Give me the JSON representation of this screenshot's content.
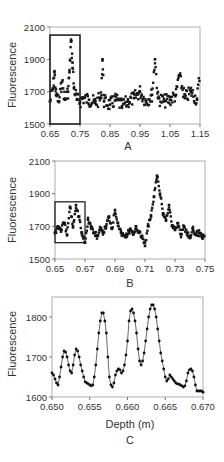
{
  "chart_data": [
    {
      "panel": "A",
      "type": "scatter",
      "title": "",
      "xlabel": "",
      "ylabel": "Fluorescence",
      "caption": "A",
      "xlim": [
        0.65,
        1.15
      ],
      "ylim": [
        1500,
        2100
      ],
      "xticks": [
        "0.65",
        "0.75",
        "0.85",
        "0.95",
        "1.05",
        "1.15"
      ],
      "yticks": [
        "1500",
        "1700",
        "1900",
        "2100"
      ],
      "grid": false,
      "highlight_box": {
        "x": [
          0.65,
          0.75
        ],
        "y": [
          1500,
          2050
        ]
      },
      "x": [
        0.65,
        0.66,
        0.665,
        0.67,
        0.68,
        0.69,
        0.7,
        0.71,
        0.715,
        0.72,
        0.725,
        0.73,
        0.74,
        0.75,
        0.76,
        0.78,
        0.8,
        0.82,
        0.825,
        0.83,
        0.85,
        0.87,
        0.89,
        0.91,
        0.93,
        0.95,
        0.97,
        0.99,
        1.0,
        1.01,
        1.03,
        1.05,
        1.07,
        1.08,
        1.1,
        1.12,
        1.14,
        1.15
      ],
      "values": [
        1640,
        1720,
        1820,
        1680,
        1640,
        1760,
        1650,
        1700,
        1820,
        2010,
        1880,
        1720,
        1650,
        1640,
        1660,
        1650,
        1630,
        1660,
        1900,
        1640,
        1620,
        1650,
        1610,
        1640,
        1660,
        1700,
        1640,
        1680,
        1900,
        1660,
        1640,
        1650,
        1680,
        1800,
        1660,
        1700,
        1650,
        1820
      ]
    },
    {
      "panel": "B",
      "type": "scatter",
      "title": "",
      "xlabel": "",
      "ylabel": "Fluorescence",
      "caption": "B",
      "xlim": [
        0.65,
        0.75
      ],
      "ylim": [
        1500,
        2100
      ],
      "xticks": [
        "0.65",
        "0.67",
        "0.69",
        "0.71",
        "0.73",
        "0.75"
      ],
      "yticks": [
        "1500",
        "1700",
        "1900",
        "2100"
      ],
      "grid": false,
      "highlight_box": {
        "x": [
          0.65,
          0.67
        ],
        "y": [
          1600,
          1850
        ]
      },
      "x": [
        0.65,
        0.652,
        0.654,
        0.656,
        0.658,
        0.66,
        0.662,
        0.664,
        0.666,
        0.668,
        0.67,
        0.672,
        0.674,
        0.676,
        0.678,
        0.68,
        0.682,
        0.684,
        0.686,
        0.688,
        0.69,
        0.692,
        0.694,
        0.696,
        0.698,
        0.7,
        0.702,
        0.704,
        0.706,
        0.708,
        0.71,
        0.712,
        0.714,
        0.716,
        0.718,
        0.72,
        0.722,
        0.724,
        0.726,
        0.728,
        0.73,
        0.732,
        0.734,
        0.736,
        0.738,
        0.74,
        0.742,
        0.744,
        0.746,
        0.748,
        0.75
      ],
      "values": [
        1660,
        1700,
        1680,
        1720,
        1650,
        1820,
        1700,
        1830,
        1760,
        1650,
        1600,
        1740,
        1700,
        1660,
        1640,
        1680,
        1660,
        1700,
        1760,
        1690,
        1800,
        1720,
        1660,
        1640,
        1650,
        1680,
        1650,
        1700,
        1660,
        1640,
        1580,
        1700,
        1760,
        1880,
        2010,
        1900,
        1780,
        1740,
        1830,
        1700,
        1680,
        1720,
        1650,
        1700,
        1660,
        1640,
        1680,
        1650,
        1660,
        1640,
        1650
      ]
    },
    {
      "panel": "C",
      "type": "line",
      "title": "",
      "xlabel": "Depth (m)",
      "ylabel": "Fluorescence",
      "caption": "C",
      "xlim": [
        0.65,
        0.67
      ],
      "ylim": [
        1600,
        1850
      ],
      "xticks": [
        "0.650",
        "0.655",
        "0.660",
        "0.665",
        "0.670"
      ],
      "yticks": [
        "1600",
        "1700",
        "1800"
      ],
      "grid": false,
      "x": [
        0.65,
        0.6502,
        0.6504,
        0.6506,
        0.6508,
        0.651,
        0.6512,
        0.6514,
        0.6516,
        0.6518,
        0.652,
        0.6522,
        0.6524,
        0.6526,
        0.6528,
        0.653,
        0.6532,
        0.6534,
        0.6536,
        0.6538,
        0.654,
        0.6542,
        0.6544,
        0.6546,
        0.6548,
        0.655,
        0.6552,
        0.6554,
        0.6556,
        0.6558,
        0.656,
        0.6562,
        0.6564,
        0.6566,
        0.6568,
        0.657,
        0.6572,
        0.6574,
        0.6576,
        0.6578,
        0.658,
        0.6582,
        0.6584,
        0.6586,
        0.6588,
        0.659,
        0.6592,
        0.6594,
        0.6596,
        0.6598,
        0.66,
        0.6602,
        0.6604,
        0.6606,
        0.6608,
        0.661,
        0.6612,
        0.6614,
        0.6616,
        0.6618,
        0.662,
        0.6622,
        0.6624,
        0.6626,
        0.6628,
        0.663,
        0.6632,
        0.6634,
        0.6636,
        0.6638,
        0.664,
        0.6642,
        0.6644,
        0.6646,
        0.6648,
        0.665,
        0.6652,
        0.6654,
        0.6656,
        0.6658,
        0.666,
        0.6662,
        0.6664,
        0.6666,
        0.6668,
        0.667,
        0.6672,
        0.6674,
        0.6676,
        0.6678,
        0.668,
        0.6682,
        0.6684,
        0.6686,
        0.6688,
        0.669,
        0.6692,
        0.6694,
        0.6696,
        0.6698,
        0.67
      ],
      "values": [
        1660,
        1655,
        1645,
        1635,
        1630,
        1650,
        1675,
        1700,
        1715,
        1712,
        1700,
        1680,
        1665,
        1660,
        1680,
        1705,
        1720,
        1715,
        1700,
        1680,
        1665,
        1650,
        1638,
        1635,
        1633,
        1630,
        1628,
        1630,
        1650,
        1680,
        1720,
        1760,
        1790,
        1810,
        1810,
        1790,
        1760,
        1700,
        1650,
        1630,
        1625,
        1635,
        1655,
        1665,
        1670,
        1668,
        1660,
        1665,
        1680,
        1705,
        1740,
        1790,
        1815,
        1820,
        1810,
        1790,
        1760,
        1720,
        1690,
        1680,
        1690,
        1710,
        1740,
        1770,
        1800,
        1820,
        1830,
        1830,
        1820,
        1800,
        1770,
        1740,
        1710,
        1690,
        1670,
        1650,
        1640,
        1645,
        1655,
        1650,
        1645,
        1640,
        1635,
        1633,
        1632,
        1630,
        1628,
        1625,
        1628,
        1640,
        1660,
        1668,
        1670,
        1665,
        1650,
        1630,
        1615,
        1615,
        1615,
        1615,
        1612
      ]
    }
  ]
}
